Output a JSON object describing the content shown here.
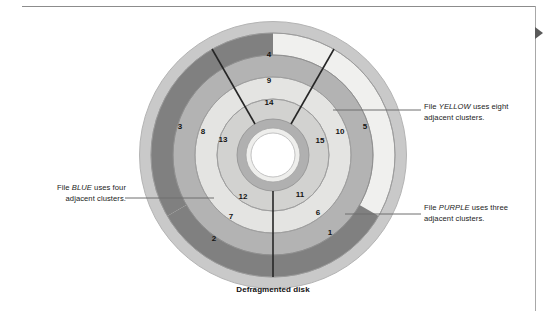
{
  "figure": {
    "caption": "Defragmented disk",
    "center": {
      "x": 273,
      "y": 155
    },
    "rings": [
      {
        "name": "outer-edge",
        "r_outer": 134,
        "r_inner": 122,
        "fill": "#c9c9c9"
      },
      {
        "name": "ring-track-1",
        "r_outer": 122,
        "r_inner": 100,
        "fill": "#f0f0ee"
      },
      {
        "name": "ring-track-2",
        "r_outer": 100,
        "r_inner": 78,
        "fill": "#b3b3b3"
      },
      {
        "name": "ring-track-3",
        "r_outer": 78,
        "r_inner": 56,
        "fill": "#e4e4e2"
      },
      {
        "name": "ring-track-4",
        "r_outer": 56,
        "r_inner": 36,
        "fill": "#d2d2d0"
      },
      {
        "name": "hub-ring",
        "r_outer": 36,
        "r_inner": 27,
        "fill": "#b0b0b0"
      },
      {
        "name": "hub-inner",
        "r_outer": 27,
        "r_inner": 22,
        "fill": "#eeeeec"
      },
      {
        "name": "spindle-hole",
        "r_outer": 22,
        "r_inner": 0,
        "fill": "#ffffff"
      }
    ],
    "colors": {
      "file_yellow": "#b3b3b3",
      "file_blue": "#808080",
      "file_purple": "#808080",
      "free_light": "#f0f0ee",
      "free_mid": "#d2d2d0",
      "disk_edge": "#c9c9c9",
      "outline": "#8f8f8f",
      "divider": "#262626",
      "leader": "#6e6e6e"
    },
    "sector_divider_angles_deg": [
      60,
      180,
      300
    ],
    "clusters": [
      {
        "label": "1",
        "x": 330,
        "y": 233
      },
      {
        "label": "2",
        "x": 214,
        "y": 239
      },
      {
        "label": "3",
        "x": 180,
        "y": 127
      },
      {
        "label": "4",
        "x": 269,
        "y": 55
      },
      {
        "label": "5",
        "x": 365,
        "y": 127
      },
      {
        "label": "6",
        "x": 318,
        "y": 213
      },
      {
        "label": "7",
        "x": 231,
        "y": 217
      },
      {
        "label": "8",
        "x": 203,
        "y": 132
      },
      {
        "label": "9",
        "x": 269,
        "y": 81
      },
      {
        "label": "10",
        "x": 340,
        "y": 132
      },
      {
        "label": "11",
        "x": 300,
        "y": 195
      },
      {
        "label": "12",
        "x": 243,
        "y": 197
      },
      {
        "label": "13",
        "x": 223,
        "y": 140
      },
      {
        "label": "14",
        "x": 269,
        "y": 103
      },
      {
        "label": "15",
        "x": 320,
        "y": 141
      }
    ],
    "callouts": [
      {
        "name": "callout-yellow",
        "line1_pre": "File ",
        "line1_em": "YELLOW",
        "line1_post": " uses eight",
        "line2": "adjacent clusters."
      },
      {
        "name": "callout-purple",
        "line1_pre": "File ",
        "line1_em": "PURPLE",
        "line1_post": " uses three",
        "line2": "adjacent clusters."
      },
      {
        "name": "callout-blue",
        "line1_pre": "File ",
        "line1_em": "BLUE",
        "line1_post": " uses four",
        "line2": "adjacent clusters."
      }
    ],
    "leader_lines": [
      {
        "name": "leader-yellow",
        "x1": 333,
        "y1": 110,
        "x2": 421,
        "y2": 110
      },
      {
        "name": "leader-purple",
        "x1": 345,
        "y1": 214,
        "x2": 421,
        "y2": 214
      },
      {
        "name": "leader-blue",
        "x1": 125,
        "y1": 198,
        "x2": 214,
        "y2": 198
      }
    ]
  },
  "page_marks": {
    "top_rule": true,
    "right_rule": true,
    "marker": "triangle-right-marker"
  }
}
